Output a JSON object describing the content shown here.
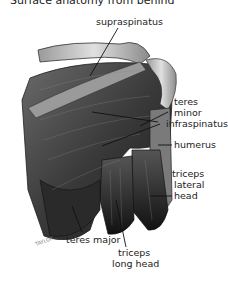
{
  "title": "Surface anatomy from behind",
  "labels": {
    "supraspinatus": "supraspinatus",
    "teres_minor_1": "teres",
    "teres_minor_2": "minor",
    "infraspinatus": "infraspinatus",
    "humerus": "humerus",
    "triceps_lateral_1": "triceps",
    "triceps_lateral_2": "lateral",
    "triceps_lateral_3": "head",
    "teres_major": "teres major",
    "triceps_long_1": "triceps",
    "triceps_long_2": "long head"
  },
  "signature": "TAYLOR"
}
